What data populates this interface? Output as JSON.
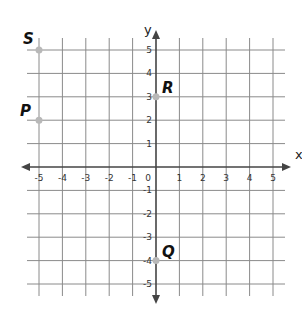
{
  "chart_data": {
    "type": "scatter",
    "title": "",
    "xlabel": "x",
    "ylabel": "y",
    "xlim": [
      -5,
      5
    ],
    "ylim": [
      -5,
      5
    ],
    "grid": true,
    "x_ticks": [
      "-5",
      "-4",
      "-3",
      "-2",
      "-1",
      "0",
      "1",
      "2",
      "3",
      "4",
      "5"
    ],
    "y_ticks": [
      "5",
      "4",
      "3",
      "2",
      "1",
      "-1",
      "-2",
      "-3",
      "-4",
      "-5"
    ],
    "points": [
      {
        "label": "S",
        "x": -5,
        "y": 5
      },
      {
        "label": "P",
        "x": -5,
        "y": 2
      },
      {
        "label": "R",
        "x": 0,
        "y": 3
      },
      {
        "label": "Q",
        "x": 0,
        "y": -4
      }
    ]
  },
  "colors": {
    "grid": "#8a8a8a",
    "axis": "#444444",
    "point": "#b8b8b8"
  }
}
